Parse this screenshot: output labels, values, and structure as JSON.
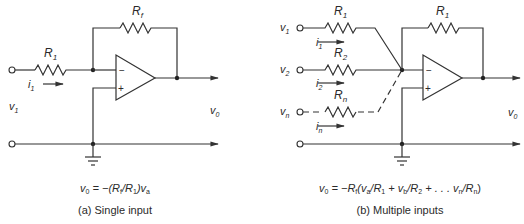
{
  "circuit_a": {
    "input_resistor": {
      "name": "R",
      "sub": "1"
    },
    "feedback_resistor": {
      "name": "R",
      "sub": "f"
    },
    "input_voltage": {
      "name": "v",
      "sub": "1"
    },
    "output_voltage": {
      "name": "v",
      "sub": "0"
    },
    "input_current": {
      "name": "i",
      "sub": "1"
    },
    "opamp_minus": "−",
    "opamp_plus": "+",
    "equation": {
      "p1": "v",
      "p1_sub": "0",
      "p2": " = −(R",
      "p2_sub": "f",
      "p3": "/R",
      "p3_sub": "1",
      "p4": ")v",
      "p4_sub": "a"
    },
    "caption": "(a) Single input"
  },
  "circuit_b": {
    "inputs": [
      {
        "voltage": "v",
        "voltage_sub": "1",
        "resistor": "R",
        "resistor_sub": "1",
        "current": "i",
        "current_sub": "1"
      },
      {
        "voltage": "v",
        "voltage_sub": "2",
        "resistor": "R",
        "resistor_sub": "2",
        "current": "i",
        "current_sub": "2"
      },
      {
        "voltage": "v",
        "voltage_sub": "n",
        "resistor": "R",
        "resistor_sub": "n",
        "current": "i",
        "current_sub": "n"
      }
    ],
    "feedback_resistor": {
      "name": "R",
      "sub": "1"
    },
    "output_voltage": {
      "name": "v",
      "sub": "0"
    },
    "opamp_minus": "−",
    "opamp_plus": "+",
    "equation": {
      "p1": "v",
      "p1_sub": "0",
      "p2": " = −R",
      "p2_sub": "f",
      "p3": "(v",
      "p3_sub": "a",
      "p4": "/R",
      "p4_sub": "1",
      "p5": " + v",
      "p5_sub": "b",
      "p6": "/R",
      "p6_sub": "2",
      "p7": " + . . . v",
      "p7_sub": "n",
      "p8": "/R",
      "p8_sub": "n",
      "p9": ")"
    },
    "caption": "(b) Multiple inputs"
  }
}
